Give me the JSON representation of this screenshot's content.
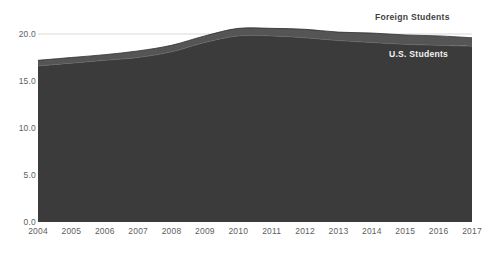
{
  "chart_data": {
    "type": "area",
    "stacked": true,
    "title": "",
    "subtitle": "",
    "xlabel": "",
    "ylabel": "",
    "grid": true,
    "gridlines_y": [
      20.0
    ],
    "legend_position": "inline-right",
    "xlim": [
      2004,
      2017
    ],
    "ylim": [
      0.0,
      21.5
    ],
    "yticks": [
      "0.0",
      "5.0",
      "10.0",
      "15.0",
      "20.0"
    ],
    "ytick_values": [
      0.0,
      5.0,
      10.0,
      15.0,
      20.0
    ],
    "categories": [
      2004,
      2005,
      2006,
      2007,
      2008,
      2009,
      2010,
      2011,
      2012,
      2013,
      2014,
      2015,
      2016,
      2017
    ],
    "xticks": [
      "2004",
      "2005",
      "2006",
      "2007",
      "2008",
      "2009",
      "2010",
      "2011",
      "2012",
      "2013",
      "2014",
      "2015",
      "2016",
      "2017"
    ],
    "series": [
      {
        "name": "U.S. Students",
        "color": "#3b3b3b",
        "values": [
          16.6,
          16.9,
          17.2,
          17.5,
          18.1,
          19.1,
          19.8,
          19.8,
          19.6,
          19.3,
          19.1,
          18.9,
          18.8,
          18.7
        ]
      },
      {
        "name": "Foreign Students",
        "color": "#555555",
        "values": [
          0.6,
          0.6,
          0.6,
          0.7,
          0.7,
          0.7,
          0.8,
          0.8,
          0.9,
          0.9,
          1.0,
          1.0,
          1.0,
          0.9
        ]
      }
    ],
    "totals": [
      17.2,
      17.5,
      17.8,
      18.2,
      18.8,
      19.8,
      20.6,
      20.6,
      20.5,
      20.2,
      20.1,
      19.9,
      19.8,
      19.6
    ]
  },
  "labels": {
    "foreign_students": "Foreign Students",
    "us_students": "U.S. Students"
  },
  "colors": {
    "us_fill": "#3b3b3b",
    "foreign_fill": "#555555",
    "gridline": "#cfcfcf",
    "axis_text": "#5e5e5e",
    "background": "#ffffff"
  }
}
